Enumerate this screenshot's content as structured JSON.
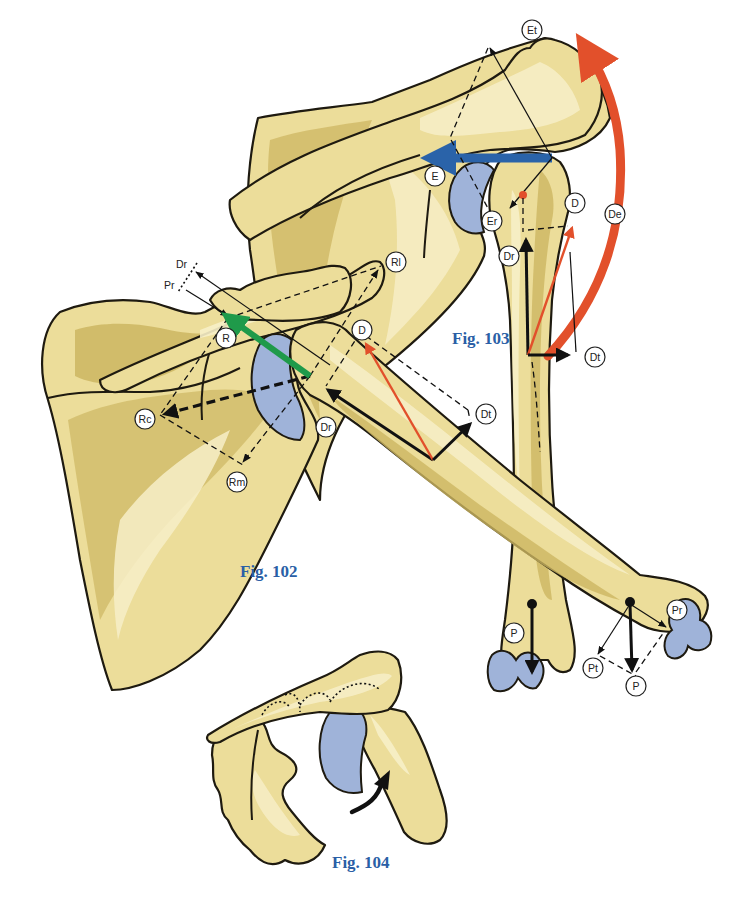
{
  "figures": {
    "fig102": {
      "caption": "Fig. 102"
    },
    "fig103": {
      "caption": "Fig. 103"
    },
    "fig104": {
      "caption": "Fig. 104"
    }
  },
  "labels": {
    "fig103": {
      "Et": "Et",
      "E": "E",
      "Er": "Er",
      "Dr": "Dr",
      "D": "D",
      "De": "De",
      "Dt": "Dt"
    },
    "fig102": {
      "Dr_top": "Dr",
      "Pr_top": "Pr",
      "R": "R",
      "Rl": "Rl",
      "Rc": "Rc",
      "Rm": "Rm",
      "Dr": "Dr",
      "D": "D",
      "Dt": "Dt"
    },
    "forearm": {
      "P_left": "P",
      "Pr": "Pr",
      "Pt": "Pt",
      "P_right": "P"
    }
  },
  "colors": {
    "bone": "#ecdd9a",
    "bone_shade": "#cdb662",
    "cartilage": "#9fb3d9",
    "red_arrow": "#e2502b",
    "blue_arrow": "#2a63a9",
    "green_arrow": "#1f9a4a",
    "caption": "#2a5fa6"
  }
}
